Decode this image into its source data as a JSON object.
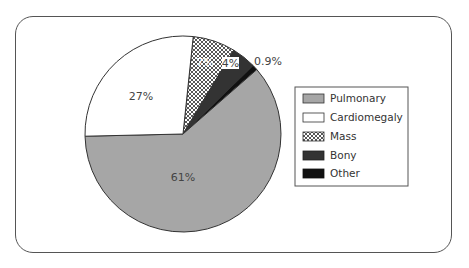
{
  "chart_data": {
    "type": "pie",
    "title": "",
    "categories": [
      "Pulmonary",
      "Cardiomegaly",
      "Mass",
      "Bony",
      "Other"
    ],
    "values": [
      61,
      27,
      7,
      4,
      0.9
    ],
    "labels": [
      "61%",
      "27%",
      "7%",
      "4%",
      "0.9%"
    ],
    "colors": [
      "#a6a6a6",
      "#ffffff",
      "crosshatch",
      "#333333",
      "#111111"
    ],
    "legend_position": "right"
  },
  "legend": {
    "items": [
      {
        "label": "Pulmonary"
      },
      {
        "label": "Cardiomegaly"
      },
      {
        "label": "Mass"
      },
      {
        "label": "Bony"
      },
      {
        "label": "Other"
      }
    ]
  }
}
